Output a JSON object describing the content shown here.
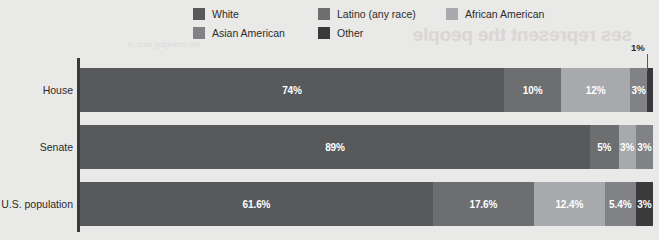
{
  "legend": {
    "rows": [
      [
        {
          "label": "White",
          "color": "#58595b",
          "swatch_name": "legend-swatch-white"
        },
        {
          "label": "Latino (any race)",
          "color": "#6d6e70",
          "swatch_name": "legend-swatch-latino"
        },
        {
          "label": "African American",
          "color": "#a7a9ac",
          "swatch_name": "legend-swatch-african-american"
        }
      ],
      [
        {
          "label": "Asian American",
          "color": "#808285",
          "swatch_name": "legend-swatch-asian-american"
        },
        {
          "label": "Other",
          "color": "#3a3a3c",
          "swatch_name": "legend-swatch-other"
        }
      ]
    ]
  },
  "callout": {
    "label": "1%"
  },
  "ghost_text": {
    "headline": "ses represent the people",
    "subtext": "the changing face of"
  },
  "chart_data": {
    "type": "bar",
    "orientation": "horizontal",
    "stacked": true,
    "normalized_percent": true,
    "title": "",
    "subtitle": "",
    "xlabel": "",
    "ylabel": "",
    "xlim": [
      0,
      100
    ],
    "grid": false,
    "legend_position": "top",
    "categories": [
      "House",
      "Senate",
      "U.S. population"
    ],
    "series": [
      {
        "name": "White",
        "color": "#58595b",
        "values": [
          74,
          89,
          61.6
        ],
        "labels": [
          "74%",
          "89%",
          "61.6%"
        ]
      },
      {
        "name": "Latino (any race)",
        "color": "#6d6e70",
        "values": [
          10,
          5,
          17.6
        ],
        "labels": [
          "10%",
          "5%",
          "17.6%"
        ]
      },
      {
        "name": "African American",
        "color": "#a7a9ac",
        "values": [
          12,
          3,
          12.4
        ],
        "labels": [
          "12%",
          "3%",
          "12.4%"
        ]
      },
      {
        "name": "Asian American",
        "color": "#808285",
        "values": [
          3,
          3,
          5.4
        ],
        "labels": [
          "3%",
          "3%",
          "5.4%"
        ]
      },
      {
        "name": "Other",
        "color": "#3a3a3c",
        "values": [
          1,
          0,
          3
        ],
        "labels": [
          "1%",
          "",
          "3%"
        ]
      }
    ],
    "rows": [
      {
        "category": "House",
        "segments": [
          {
            "name": "White",
            "value": 74,
            "label": "74%",
            "color": "#58595b",
            "show_label": true
          },
          {
            "name": "Latino (any race)",
            "value": 10,
            "label": "10%",
            "color": "#6d6e70",
            "show_label": true
          },
          {
            "name": "African American",
            "value": 12,
            "label": "12%",
            "color": "#a7a9ac",
            "show_label": true
          },
          {
            "name": "Asian American",
            "value": 3,
            "label": "3%",
            "color": "#808285",
            "show_label": true
          },
          {
            "name": "Other",
            "value": 1,
            "label": "1%",
            "color": "#3a3a3c",
            "show_label": false
          }
        ]
      },
      {
        "category": "Senate",
        "segments": [
          {
            "name": "White",
            "value": 89,
            "label": "89%",
            "color": "#58595b",
            "show_label": true
          },
          {
            "name": "Latino (any race)",
            "value": 5,
            "label": "5%",
            "color": "#6d6e70",
            "show_label": true
          },
          {
            "name": "African American",
            "value": 3,
            "label": "3%",
            "color": "#a7a9ac",
            "show_label": true
          },
          {
            "name": "Asian American",
            "value": 3,
            "label": "3%",
            "color": "#808285",
            "show_label": true
          }
        ]
      },
      {
        "category": "U.S. population",
        "segments": [
          {
            "name": "White",
            "value": 61.6,
            "label": "61.6%",
            "color": "#58595b",
            "show_label": true
          },
          {
            "name": "Latino (any race)",
            "value": 17.6,
            "label": "17.6%",
            "color": "#6d6e70",
            "show_label": true
          },
          {
            "name": "African American",
            "value": 12.4,
            "label": "12.4%",
            "color": "#a7a9ac",
            "show_label": true
          },
          {
            "name": "Asian American",
            "value": 5.4,
            "label": "5.4%",
            "color": "#808285",
            "show_label": true
          },
          {
            "name": "Other",
            "value": 3,
            "label": "3%",
            "color": "#3a3a3c",
            "show_label": true
          }
        ]
      }
    ],
    "annotations": [
      {
        "text": "1%",
        "points_to": {
          "category": "House",
          "segment": "Other"
        }
      }
    ]
  }
}
